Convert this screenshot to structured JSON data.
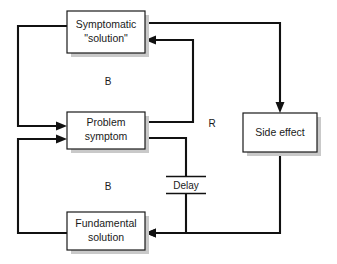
{
  "diagram": {
    "canvas": {
      "width": 337,
      "height": 264,
      "background": "#ffffff"
    },
    "colors": {
      "line": "#111111",
      "box_border": "#1a1a1a",
      "box_fill": "#ffffff",
      "box_shadow": "#c9c9c9",
      "text": "#1a1a1a"
    },
    "nodes": [
      {
        "id": "symptomatic-solution",
        "line1": "Symptomatic",
        "line2": "\"solution\"",
        "x": 67,
        "y": 11,
        "w": 78,
        "h": 42
      },
      {
        "id": "problem-symptom",
        "line1": "Problem",
        "line2": "symptom",
        "x": 67,
        "y": 112,
        "w": 78,
        "h": 37
      },
      {
        "id": "fundamental-solution",
        "line1": "Fundamental",
        "line2": "solution",
        "x": 67,
        "y": 212,
        "w": 78,
        "h": 38
      },
      {
        "id": "side-effect",
        "line1": "Side effect",
        "line2": "",
        "x": 243,
        "y": 113,
        "w": 74,
        "h": 39
      }
    ],
    "loop_labels": [
      {
        "id": "loop-b-upper",
        "text": "B",
        "x": 108,
        "y": 82
      },
      {
        "id": "loop-b-lower",
        "text": "B",
        "x": 108,
        "y": 187
      },
      {
        "id": "loop-r",
        "text": "R",
        "x": 212,
        "y": 124
      }
    ],
    "delay": {
      "id": "delay-marker",
      "text": "Delay",
      "x": 186,
      "y": 185
    },
    "edges": [
      {
        "id": "edge-symptomatic-to-problem",
        "from": "symptomatic-solution",
        "to": "problem-symptom",
        "label": ""
      },
      {
        "id": "edge-problem-to-symptomatic",
        "from": "problem-symptom",
        "to": "symptomatic-solution",
        "label": ""
      },
      {
        "id": "edge-symptomatic-to-side-effect",
        "from": "symptomatic-solution",
        "to": "side-effect",
        "label": ""
      },
      {
        "id": "edge-side-effect-to-fundamental",
        "from": "side-effect",
        "to": "fundamental-solution",
        "label": ""
      },
      {
        "id": "edge-problem-to-fundamental-delayed",
        "from": "problem-symptom",
        "to": "fundamental-solution",
        "label": "Delay"
      },
      {
        "id": "edge-fundamental-to-problem",
        "from": "fundamental-solution",
        "to": "problem-symptom",
        "label": ""
      }
    ]
  }
}
